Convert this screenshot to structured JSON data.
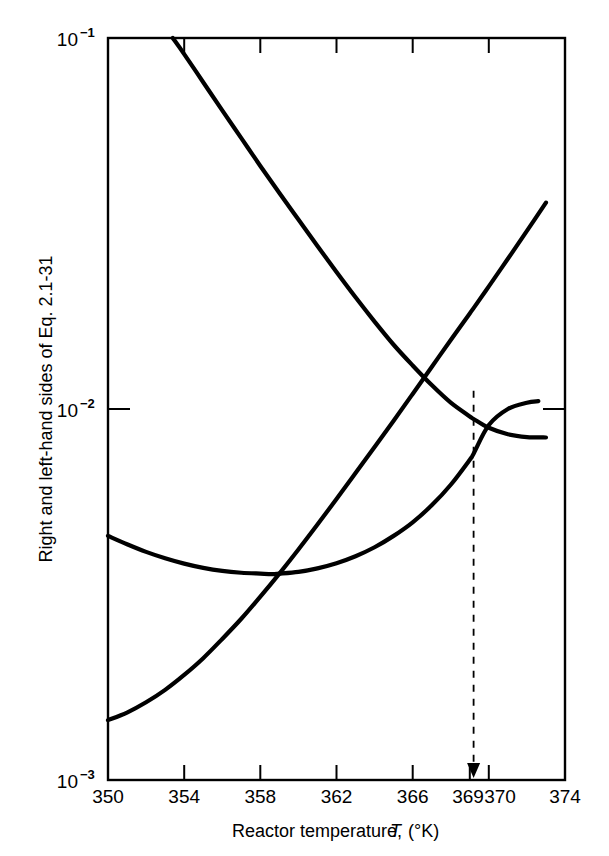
{
  "figure": {
    "background_color": "#ffffff",
    "ink_color": "#000000"
  },
  "chart_data": {
    "type": "line",
    "title": "",
    "subtitle": "",
    "xlabel": "Reactor temperature, T (°K)",
    "xlabel_parts": {
      "lead": "Reactor temperature,",
      "symbol": "T",
      "units": "(°K)"
    },
    "ylabel": "Right and left-hand sides of Eq. 2.1-31",
    "xscale": "linear",
    "yscale": "log",
    "xlim": [
      350,
      374
    ],
    "ylim": [
      0.001,
      0.1
    ],
    "grid": false,
    "legend_position": "none",
    "xticks": [
      350,
      354,
      358,
      362,
      366,
      369,
      370,
      374
    ],
    "xtick_labels": [
      "350",
      "354",
      "358",
      "362",
      "366",
      "369",
      "370",
      "374"
    ],
    "yticks": [
      0.001,
      0.01,
      0.1
    ],
    "ytick_labels": [
      "10-3",
      "10-2",
      "10-1"
    ],
    "ytick_label_parts": [
      {
        "base": "10",
        "exp": "−3"
      },
      {
        "base": "10",
        "exp": "−2"
      },
      {
        "base": "10",
        "exp": "−1"
      }
    ],
    "series": [
      {
        "name": "right-hand side (heat removal, decreasing branch)",
        "style": "solid",
        "x": [
          353.4,
          354,
          355,
          356,
          357,
          358,
          359,
          360,
          361,
          362,
          363,
          364,
          365,
          366,
          367,
          368,
          369,
          369.2,
          370,
          371,
          372,
          373
        ],
        "y": [
          0.1,
          0.0905,
          0.076,
          0.0638,
          0.0537,
          0.0452,
          0.0382,
          0.0324,
          0.0275,
          0.0234,
          0.02,
          0.0172,
          0.0149,
          0.0131,
          0.0116,
          0.0104,
          0.00955,
          0.0094,
          0.0089,
          0.00855,
          0.0084,
          0.00838
        ]
      },
      {
        "name": "left-hand side (heat generation, sigmoid branch)",
        "style": "solid",
        "x": [
          350,
          351,
          352,
          353,
          354,
          355,
          356,
          357,
          358,
          359,
          360,
          361,
          362,
          363,
          364,
          365,
          366,
          367,
          368,
          369,
          369.2,
          370,
          371,
          372,
          373
        ],
        "y": [
          0.00145,
          0.00152,
          0.00162,
          0.00175,
          0.00192,
          0.00213,
          0.0024,
          0.00272,
          0.00312,
          0.0036,
          0.00418,
          0.00488,
          0.00572,
          0.00672,
          0.0079,
          0.0093,
          0.01098,
          0.01298,
          0.01535,
          0.0181,
          0.0187,
          0.0214,
          0.0254,
          0.0302,
          0.036
        ]
      },
      {
        "name": "steady-state operating line (lower shallow curve)",
        "style": "solid",
        "x": [
          350,
          351,
          352,
          353,
          354,
          355,
          356,
          357,
          358,
          358.6,
          359,
          360,
          361,
          362,
          363,
          364,
          365,
          366,
          367,
          368,
          369,
          369.2,
          370,
          371,
          372,
          372.6
        ],
        "y": [
          0.00455,
          0.00432,
          0.00412,
          0.00396,
          0.00383,
          0.00373,
          0.00366,
          0.00362,
          0.0036,
          0.00359,
          0.0036,
          0.00364,
          0.00372,
          0.00384,
          0.00401,
          0.00424,
          0.00455,
          0.00495,
          0.0055,
          0.00625,
          0.0073,
          0.00758,
          0.00905,
          0.01,
          0.0104,
          0.0105
        ]
      }
    ],
    "annotations": [
      {
        "name": "intersection-marker",
        "kind": "dashed-drop-line-with-arrow",
        "x": 369.2,
        "y": 0.0112,
        "label": ""
      }
    ]
  },
  "axes": {
    "x_axis_name": "reactor-temperature-axis",
    "y_axis_name": "equation-sides-axis"
  }
}
